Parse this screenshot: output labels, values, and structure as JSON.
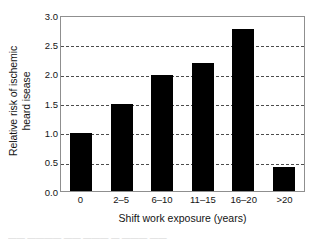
{
  "chart_data": {
    "type": "bar",
    "title": "",
    "xlabel": "Shift work exposure (years)",
    "ylabel_line1": "Relative risk of ischemic",
    "ylabel_line2": "heard isease",
    "categories": [
      "0",
      "2–5",
      "6–10",
      "11–15",
      "16–20",
      ">20"
    ],
    "values": [
      1.0,
      1.5,
      2.0,
      2.2,
      2.8,
      0.42
    ],
    "ylim": [
      0.0,
      3.0
    ],
    "ytick_labels": [
      "3.0",
      "2.5",
      "2.0",
      "1.5",
      "1.0",
      "0.5",
      "0.0"
    ],
    "ytick_values": [
      3.0,
      2.5,
      2.0,
      1.5,
      1.0,
      0.5,
      0.0
    ],
    "grid": "horizontal-dashed",
    "legend": "none",
    "bar_color": "#000000",
    "grid_color": "#4d4d4d",
    "frame_color": "#8f8f8f"
  },
  "caption_fragment": "——  ————  ——  ———  —  ———  ——"
}
